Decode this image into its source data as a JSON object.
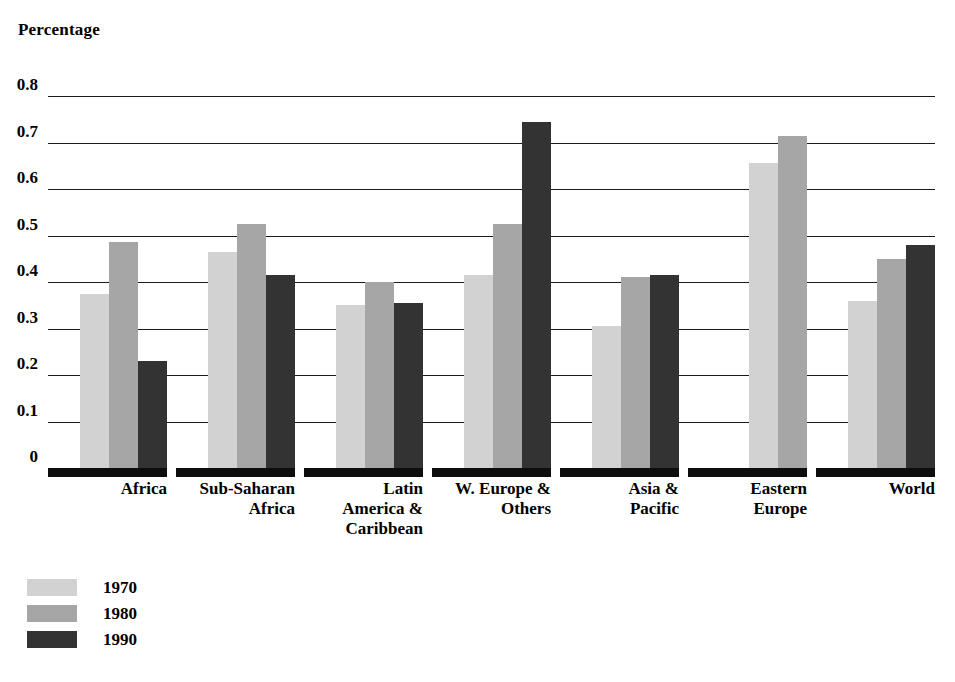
{
  "chart_data": {
    "type": "bar",
    "title": "",
    "ylabel": "Percentage",
    "xlabel": "",
    "ylim": [
      0,
      0.8
    ],
    "yticks": [
      "0",
      "0.1",
      "0.2",
      "0.3",
      "0.4",
      "0.5",
      "0.6",
      "0.7",
      "0.8"
    ],
    "ytick_values": [
      0,
      0.1,
      0.2,
      0.3,
      0.4,
      0.5,
      0.6,
      0.7,
      0.8
    ],
    "grid": true,
    "legend_position": "bottom-left",
    "categories": [
      "Africa",
      "Sub-Saharan\nAfrica",
      "Latin\nAmerica &\nCaribbean",
      "W. Europe &\nOthers",
      "Asia &\nPacific",
      "Eastern\nEurope",
      "World"
    ],
    "series": [
      {
        "name": "1970",
        "color": "#d2d2d2",
        "values": [
          0.375,
          0.465,
          0.35,
          0.415,
          0.305,
          0.655,
          0.36
        ]
      },
      {
        "name": "1980",
        "color": "#a6a6a6",
        "values": [
          0.485,
          0.525,
          0.4,
          0.525,
          0.41,
          0.715,
          0.45
        ]
      },
      {
        "name": "1990",
        "color": "#333333",
        "values": [
          0.23,
          0.415,
          0.355,
          0.745,
          0.415,
          null,
          0.48
        ]
      }
    ]
  },
  "legend": {
    "items": [
      {
        "label": "1970",
        "color": "#d2d2d2"
      },
      {
        "label": "1980",
        "color": "#a6a6a6"
      },
      {
        "label": "1990",
        "color": "#333333"
      }
    ]
  }
}
